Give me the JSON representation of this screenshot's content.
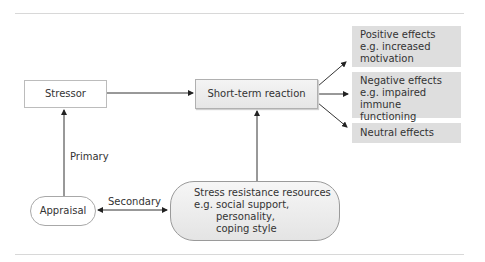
{
  "diagram": {
    "nodes": {
      "stressor": "Stressor",
      "short_term_reaction": "Short-term reaction",
      "positive": [
        "Positive effects",
        "e.g. increased",
        "motivation"
      ],
      "negative": [
        "Negative effects",
        "e.g. impaired immune",
        "functioning"
      ],
      "neutral": "Neutral effects",
      "appraisal": "Appraisal",
      "resources": [
        "Stress resistance resources",
        "e.g. social support,",
        "personality,",
        "coping style"
      ]
    },
    "edge_labels": {
      "primary": "Primary",
      "secondary": "Secondary"
    },
    "colors": {
      "effect_box": "#dedede",
      "line": "#333333",
      "rule": "#d8d8d8"
    }
  }
}
